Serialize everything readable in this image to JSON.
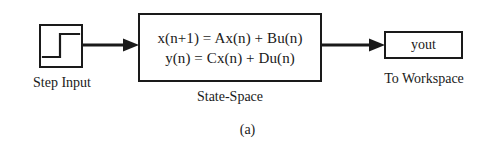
{
  "figure": {
    "caption": "(a)",
    "background_color": "#ffffff",
    "line_color": "#1a1a1a"
  },
  "blocks": {
    "step": {
      "icon": "step-waveform-icon",
      "label": "Step Input"
    },
    "state_space": {
      "equation_line1": "x(n+1) = Ax(n) + Bu(n)",
      "equation_line2": "y(n) = Cx(n) + Du(n)",
      "label": "State-Space"
    },
    "to_workspace": {
      "variable": "yout",
      "label": "To Workspace"
    }
  },
  "connections": [
    {
      "name": "step-to-state-space",
      "icon": "arrow-right-icon"
    },
    {
      "name": "state-space-to-workspace",
      "icon": "arrow-right-icon"
    }
  ]
}
